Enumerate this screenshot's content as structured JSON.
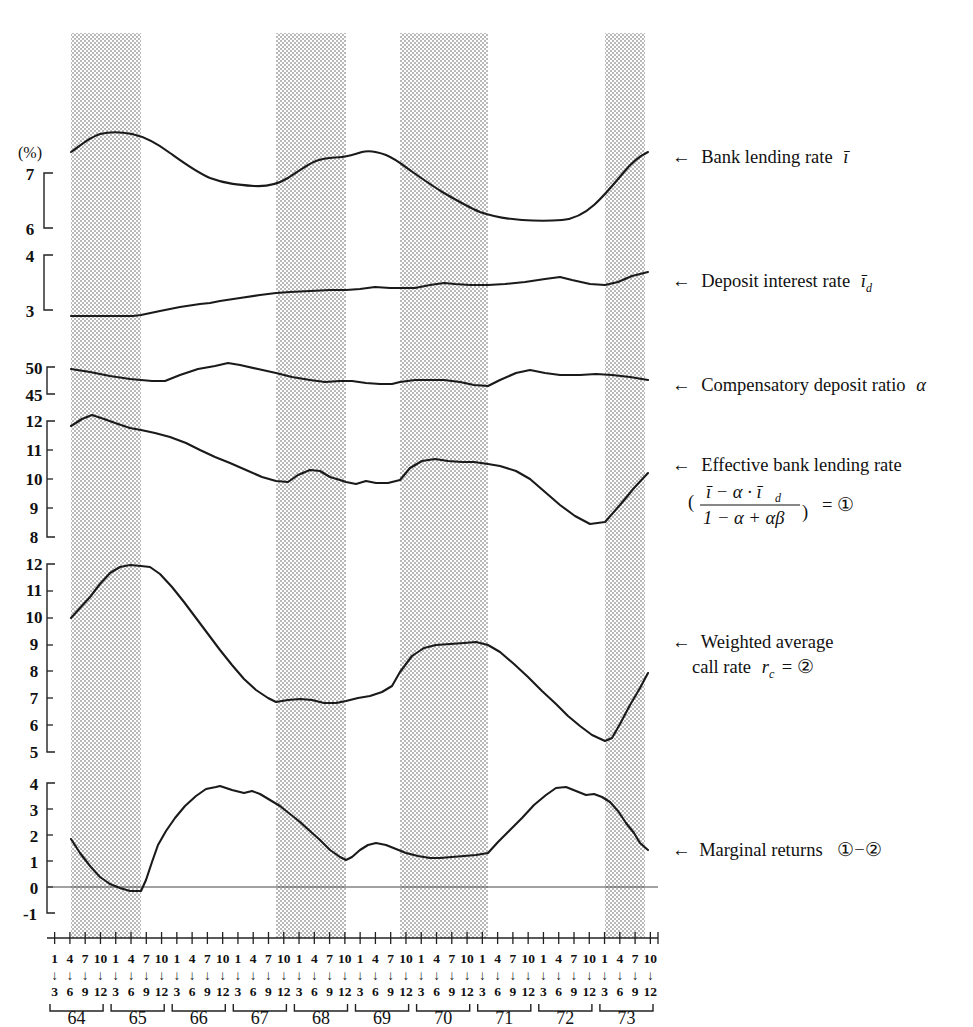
{
  "figure": {
    "unit_label": "(%)",
    "arrow": "←"
  },
  "annotations": [
    {
      "id": "bank-lending-rate",
      "text": "Bank lending rate",
      "symbol": "ī",
      "y": 157
    },
    {
      "id": "deposit-interest-rate",
      "text": "Deposit interest rate",
      "symbol": "ī",
      "sub": "d",
      "y": 281
    },
    {
      "id": "compensatory-deposit-ratio",
      "text": "Compensatory deposit ratio",
      "symbol": "α",
      "y": 385
    },
    {
      "id": "effective-bank-lending-rate",
      "text": "Effective bank lending rate",
      "y": 465,
      "formula": {
        "num": "ī − α · ī",
        "num_sub": "d",
        "den": "1 − α + αβ",
        "eq": "= ①"
      }
    },
    {
      "id": "weighted-average-call-rate",
      "line1": "Weighted average",
      "line2": "call rate",
      "symbol": "r",
      "sub": "c",
      "eq": "= ②",
      "y": 640
    },
    {
      "id": "marginal-returns",
      "text": "Marginal returns",
      "eq": "①−②",
      "y": 850
    }
  ],
  "axes": {
    "panel1": {
      "name": "bank-lending-rate-axis",
      "ticks": [
        "7",
        "6"
      ],
      "unit": "(%)"
    },
    "panel2": {
      "name": "deposit-rate-axis",
      "ticks": [
        "4",
        "3"
      ]
    },
    "panel3": {
      "name": "compensatory-ratio-axis",
      "ticks": [
        "50",
        "45"
      ]
    },
    "panel4": {
      "name": "effective-rate-axis",
      "ticks": [
        "12",
        "11",
        "10",
        "9",
        "8"
      ]
    },
    "panel5": {
      "name": "call-rate-axis",
      "ticks": [
        "12",
        "11",
        "10",
        "9",
        "8",
        "7",
        "6",
        "5"
      ]
    },
    "panel6": {
      "name": "marginal-returns-axis",
      "ticks": [
        "4",
        "3",
        "2",
        "1",
        "0",
        "-1"
      ]
    }
  },
  "xaxis": {
    "years": [
      "64",
      "65",
      "66",
      "67",
      "68",
      "69",
      "70",
      "71",
      "72",
      "73"
    ],
    "months_top": [
      "1",
      "4",
      "7",
      "10"
    ],
    "months_bottom": [
      "3",
      "6",
      "9",
      "12"
    ]
  },
  "chart_data": {
    "type": "line",
    "title": "",
    "xlabel": "",
    "ylabel": "(%)",
    "grid": false,
    "legend": "right-side arrow annotations",
    "x_unit": "quarter (year.quarter, 1964Q1 – 1973Q3)",
    "x": [
      "64.1",
      "64.2",
      "64.3",
      "64.4",
      "65.1",
      "65.2",
      "65.3",
      "65.4",
      "66.1",
      "66.2",
      "66.3",
      "66.4",
      "67.1",
      "67.2",
      "67.3",
      "67.4",
      "68.1",
      "68.2",
      "68.3",
      "68.4",
      "69.1",
      "69.2",
      "69.3",
      "69.4",
      "70.1",
      "70.2",
      "70.3",
      "70.4",
      "71.1",
      "71.2",
      "71.3",
      "71.4",
      "72.1",
      "72.2",
      "72.3",
      "72.4",
      "73.1",
      "73.2",
      "73.3"
    ],
    "shaded_bands": [
      {
        "label": "recession 1",
        "from": "64.2",
        "to": "65.4"
      },
      {
        "label": "recession 2",
        "from": "67.4",
        "to": "68.3"
      },
      {
        "label": "recession 3",
        "from": "69.4",
        "to": "70.4"
      },
      {
        "label": "recession 4",
        "from": "73.1",
        "to": "73.3"
      }
    ],
    "series": [
      {
        "name": "Bank lending rate ī",
        "ylim": [
          5.4,
          7.9
        ],
        "values": [
          7.27,
          7.52,
          7.57,
          7.54,
          7.48,
          7.38,
          7.24,
          7.12,
          7.03,
          6.96,
          6.92,
          6.88,
          6.86,
          6.89,
          7.0,
          7.1,
          7.17,
          7.14,
          7.19,
          7.2,
          7.14,
          7.08,
          7.0,
          6.9,
          6.8,
          6.7,
          6.57,
          6.44,
          6.32,
          6.22,
          6.16,
          6.14,
          6.14,
          6.14,
          6.3,
          6.6,
          6.95,
          7.2,
          7.3
        ]
      },
      {
        "name": "Deposit interest rate ī_d",
        "ylim": [
          2.6,
          4.3
        ],
        "values": [
          2.94,
          2.94,
          2.94,
          2.94,
          2.96,
          3.02,
          3.08,
          3.12,
          3.16,
          3.2,
          3.24,
          3.27,
          3.29,
          3.31,
          3.31,
          3.31,
          3.32,
          3.35,
          3.36,
          3.36,
          3.37,
          3.4,
          3.46,
          3.5,
          3.48,
          3.46,
          3.46,
          3.47,
          3.5,
          3.55,
          3.6,
          3.62,
          3.58,
          3.52,
          3.5,
          3.52,
          3.58,
          3.68,
          3.74
        ]
      },
      {
        "name": "Compensatory deposit ratio α",
        "ylim": [
          42,
          53
        ],
        "values": [
          49.8,
          49.3,
          48.7,
          48.3,
          48.2,
          48.3,
          48.7,
          49.6,
          50.1,
          50.6,
          50.3,
          49.8,
          49.4,
          48.9,
          48.4,
          47.9,
          47.7,
          47.8,
          47.8,
          47.6,
          47.3,
          47.3,
          47.4,
          47.4,
          47.2,
          47.0,
          47.5,
          48.6,
          49.6,
          50.1,
          49.6,
          49.0,
          48.8,
          48.9,
          49.0,
          48.9,
          48.6,
          48.1,
          47.7
        ]
      },
      {
        "name": "Effective bank lending rate ①",
        "ylim": [
          7.6,
          12.6
        ],
        "values": [
          12.0,
          12.3,
          12.15,
          11.95,
          11.8,
          11.7,
          11.55,
          11.4,
          11.25,
          11.1,
          10.95,
          10.8,
          10.65,
          10.5,
          10.38,
          10.33,
          10.55,
          10.62,
          10.4,
          10.35,
          10.4,
          10.38,
          10.52,
          11.05,
          11.15,
          11.1,
          11.05,
          10.95,
          10.9,
          10.8,
          10.65,
          10.4,
          10.0,
          9.45,
          9.0,
          8.75,
          8.8,
          9.55,
          10.4
        ]
      },
      {
        "name": "Weighted average call rate r_c ②",
        "ylim": [
          4.5,
          12.7
        ],
        "values": [
          9.95,
          10.9,
          11.8,
          12.35,
          12.3,
          12.25,
          11.55,
          10.35,
          9.5,
          8.55,
          7.85,
          7.25,
          6.6,
          6.7,
          6.7,
          6.68,
          6.58,
          6.75,
          7.1,
          7.55,
          8.15,
          8.75,
          9.05,
          9.1,
          9.05,
          9.3,
          9.4,
          9.38,
          9.2,
          8.75,
          8.1,
          7.35,
          6.6,
          6.2,
          5.85,
          5.1,
          5.55,
          7.0,
          8.65
        ]
      },
      {
        "name": "Marginal returns ①−②",
        "ylim": [
          -1.3,
          4.9
        ],
        "values": [
          1.85,
          1.05,
          0.3,
          -0.1,
          -0.15,
          -0.15,
          2.25,
          3.25,
          4.0,
          4.5,
          4.7,
          4.55,
          4.4,
          4.3,
          4.05,
          3.7,
          3.25,
          2.85,
          2.4,
          1.85,
          1.5,
          2.05,
          2.2,
          2.05,
          1.85,
          1.7,
          1.68,
          1.72,
          1.8,
          2.7,
          3.7,
          4.35,
          4.55,
          4.2,
          4.25,
          3.95,
          3.35,
          2.55,
          1.8
        ]
      }
    ]
  }
}
